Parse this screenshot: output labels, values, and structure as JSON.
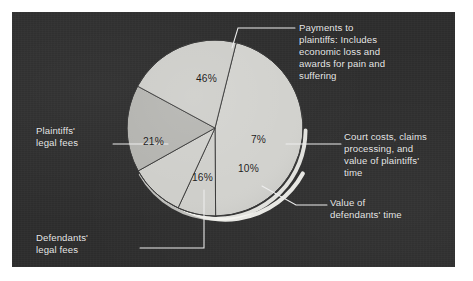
{
  "panel": {
    "background_color": "#2e2e2e",
    "page_background_color": "#ffffff"
  },
  "chart_data": {
    "type": "pie",
    "title": "",
    "subtitle": "",
    "xlabel": "",
    "ylabel": "",
    "legend_position": "callout-labels",
    "grid": false,
    "units": "percent",
    "total": 100,
    "categories": [
      "Payments to plaintiffs: Includes economic loss and awards for pain and suffering",
      "Court costs, claims processing, and value of plaintiffs' time",
      "Value of defendants' time",
      "Defendants' legal fees",
      "Plaintiffs' legal fees"
    ],
    "values": [
      46,
      7,
      10,
      16,
      21
    ],
    "slices": [
      {
        "id": "payments-to-plaintiffs",
        "label": "Payments to\nplaintiffs: Includes\neconomic loss and\nawards for pain and\nsuffering",
        "value_label": "46%",
        "value": 46,
        "color": "#d2d2ce",
        "start_deg": -76,
        "end_deg": 89.6
      },
      {
        "id": "court-costs",
        "label": "Court costs, claims\nprocessing, and\nvalue of plaintiffs'\ntime",
        "value_label": "7%",
        "value": 7,
        "color": "#cfcfcb",
        "start_deg": 89.6,
        "end_deg": 114.8
      },
      {
        "id": "value-of-defendants-time",
        "label": "Value of\ndefendants' time",
        "value_label": "10%",
        "value": 10,
        "color": "#cfcfcb",
        "start_deg": 114.8,
        "end_deg": 150.8
      },
      {
        "id": "defendants-legal-fees",
        "label": "Defendants'\nlegal fees",
        "value_label": "16%",
        "value": 16,
        "color": "#b4b4b0",
        "start_deg": 150.8,
        "end_deg": 208.4
      },
      {
        "id": "plaintiffs-legal-fees",
        "label": "Plaintiffs'\nlegal fees",
        "value_label": "21%",
        "value": 21,
        "color": "#cdcdc9",
        "start_deg": 208.4,
        "end_deg": 284
      }
    ]
  }
}
